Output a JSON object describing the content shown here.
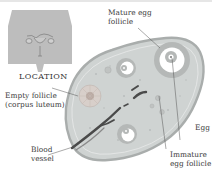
{
  "inset": {
    "caption": "LOCATION"
  },
  "labels": {
    "mature_egg_follicle": [
      "Mature egg",
      "follicle"
    ],
    "empty_follicle": [
      "Empty follicle",
      "(corpus luteum)"
    ],
    "blood_vessel": [
      "Blood",
      "vessel"
    ],
    "egg": [
      "Egg"
    ],
    "immature_egg_follicle": [
      "Immature",
      "egg follicle"
    ]
  },
  "colors": {
    "inset_body": "#bdbdbd",
    "ovary_fill": "#cfd3d2",
    "ovary_edge": "#a9adac",
    "follicle_ring": "#b5b8b7",
    "vessel": "#4a4a4a",
    "corpus_luteum": "#d8cfca"
  }
}
